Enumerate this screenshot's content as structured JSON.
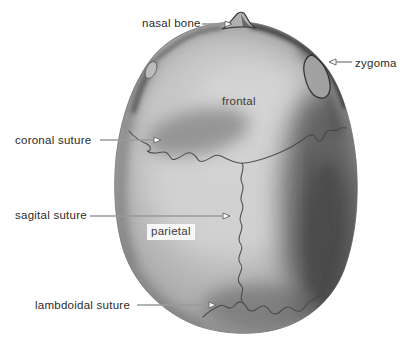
{
  "labels": {
    "nasal_bone": "nasal bone",
    "zygoma": "zygoma",
    "frontal": "frontal",
    "coronal_suture": "coronal suture",
    "sagital_suture": "sagital suture",
    "parietal": "parietal",
    "lambdoidal_suture": "lambdoidal suture"
  },
  "colors": {
    "background": "#ffffff",
    "label_text": "#2b2b2b",
    "bone_label_text": "#3a3a3a",
    "arrow_line": "#9a9a9a",
    "arrowhead_fill": "#ffffff",
    "arrowhead_outline": "#6f6f6f",
    "suture_line": "#454545",
    "skull_light": "#d2d2d2",
    "skull_mid": "#b5b5b5",
    "skull_dark_band": "#4e4e4e",
    "skull_edge_dark": "#2d2d2d"
  }
}
